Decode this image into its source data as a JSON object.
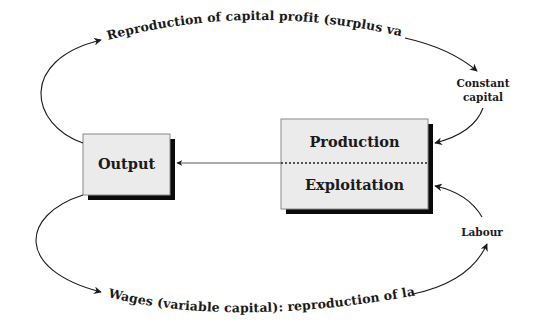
{
  "diagram": {
    "colors": {
      "box_fill": "#ebebeb",
      "box_border": "#8a8a8a",
      "box_shadow": "#0a0a0a",
      "line": "#1a1a1a",
      "text": "#1a1a1a",
      "background": "#ffffff"
    },
    "nodes": {
      "output": {
        "label": "Output"
      },
      "production": {
        "top_label": "Production",
        "bottom_label": "Exploitation"
      }
    },
    "inputs": {
      "constant_capital": {
        "line1": "Constant",
        "line2": "capital"
      },
      "labour": {
        "label": "Labour"
      }
    },
    "flows": {
      "top_arc": {
        "label": "Reproduction of capital profit (surplus value)"
      },
      "bottom_arc": {
        "label": "Wages (variable capital): reproduction of  labour"
      },
      "production_to_output": {
        "label": ""
      }
    }
  }
}
